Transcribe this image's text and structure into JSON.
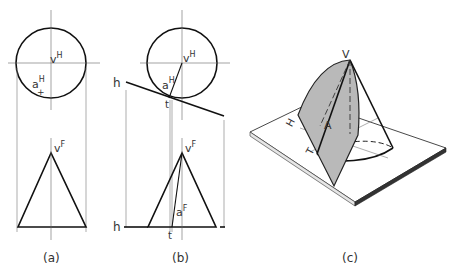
{
  "figure": {
    "panels": [
      {
        "id": "a",
        "caption": "(a)",
        "labels": {
          "vertex_top": "v",
          "vertex_top_sup": "H",
          "point_top": "a",
          "point_top_sup": "H",
          "vertex_front": "v",
          "vertex_front_sup": "F"
        }
      },
      {
        "id": "b",
        "caption": "(b)",
        "labels": {
          "vertex_top": "v",
          "vertex_top_sup": "H",
          "point_top": "a",
          "point_top_sup": "H",
          "plane_trace_top": "h",
          "tangent_top": "t",
          "vertex_front": "v",
          "vertex_front_sup": "F",
          "point_front": "a",
          "point_front_sup": "F",
          "plane_trace_front": "h",
          "tangent_front": "t"
        }
      },
      {
        "id": "c",
        "caption": "(c)",
        "labels": {
          "vertex": "V",
          "plane": "H",
          "point": "A",
          "tangent": "T"
        },
        "colors": {
          "plane_fill": "#b9b9b9",
          "base_top": "#ffffff",
          "base_edge": "#444444"
        }
      }
    ]
  }
}
